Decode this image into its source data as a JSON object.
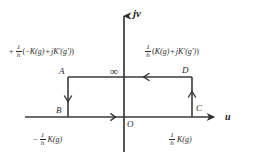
{
  "figure": {
    "type": "complex-plane-contour-diagram",
    "background": "#ffffff",
    "stroke_color": "#3a3a3a",
    "text_color": "#2a2a2a"
  },
  "axes": {
    "vertical": {
      "name": "jv",
      "direction": "up",
      "x": 124,
      "y_top": 12,
      "y_bottom": 152
    },
    "horizontal": {
      "name": "u",
      "direction": "right",
      "y": 117,
      "x_left": 25,
      "x_right": 218
    },
    "origin_label": "O"
  },
  "markers": {
    "infinity": "∞",
    "infinity_note": "top of imaginary axis"
  },
  "contour": {
    "name": "rectangle-ABCD",
    "left": 68,
    "right": 192,
    "top": 77,
    "bottom": 117,
    "vertices": [
      {
        "label": "A",
        "corner": "top-left"
      },
      {
        "label": "B",
        "corner": "bottom-left"
      },
      {
        "label": "C",
        "corner": "bottom-right"
      },
      {
        "label": "D",
        "corner": "top-right"
      }
    ],
    "arrows": [
      {
        "on": "left-edge",
        "direction": "down"
      },
      {
        "on": "top-edge",
        "direction": "left"
      },
      {
        "on": "right-edge",
        "direction": "up"
      },
      {
        "on": "horizontal-axis",
        "direction": "right"
      }
    ]
  },
  "labels": {
    "top_left_expression": {
      "plain": "+ (1/h)( - K(g) + jK'(g') )",
      "lead_sign": "+",
      "frac_num": "1",
      "frac_den": "h",
      "open_paren": "(",
      "minus": "−",
      "K": "K",
      "arg_g": "(g)",
      "plus": "+",
      "j": "j",
      "Kprime": "K′",
      "arg_gprime": "(g′)",
      "close_paren": ")"
    },
    "top_right_expression": {
      "plain": "(1/h)( K(g) + jK'(g') )",
      "frac_num": "1",
      "frac_den": "h",
      "open_paren": "(",
      "K": "K",
      "arg_g": "(g)",
      "plus": "+",
      "j": "j",
      "Kprime": "K′",
      "arg_gprime": "(g′)",
      "close_paren": ")"
    },
    "bottom_left_expression": {
      "plain": "- (1/h) K(g)",
      "lead_sign": "−",
      "frac_num": "1",
      "frac_den": "h",
      "K": "K",
      "arg_g": "(g)"
    },
    "bottom_right_expression": {
      "plain": "(1/h) K(g)",
      "frac_num": "1",
      "frac_den": "h",
      "K": "K",
      "arg_g": "(g)"
    }
  },
  "points": {
    "A": "A",
    "B": "B",
    "C": "C",
    "D": "D",
    "O": "O"
  }
}
